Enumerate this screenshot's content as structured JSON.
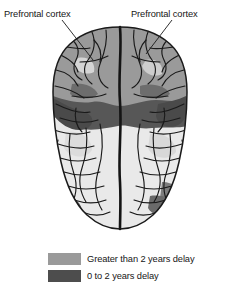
{
  "figure": {
    "type": "brain-maturation-diagram",
    "view": "dorsal-top-down",
    "background_color": "#ffffff",
    "outline_color": "#1a1a1a"
  },
  "annotations": [
    {
      "name": "prefrontal-cortex-left",
      "text": "Prefrontal cortex"
    },
    {
      "name": "prefrontal-cortex-right",
      "text": "Prefrontal cortex"
    }
  ],
  "legend": {
    "items": [
      {
        "label": "Greater than 2 years delay",
        "color": "#9a9a9a"
      },
      {
        "label": "0 to 2 years delay",
        "color": "#4d4d4d"
      }
    ]
  },
  "palette": {
    "light_region": "#e9e9e9",
    "mid_region": "#9a9a9a",
    "dark_region": "#575757",
    "darkest_region": "#3f3f3f",
    "sulcus_line": "#1a1a1a"
  }
}
